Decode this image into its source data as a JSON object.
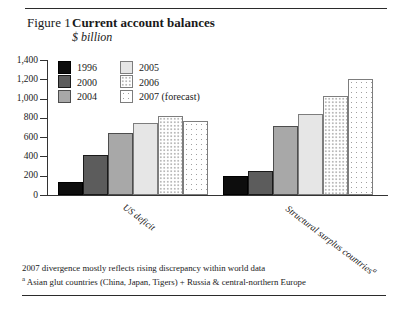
{
  "figure": {
    "label": "Figure 1",
    "title": "Current account balances",
    "subtitle": "$ billion"
  },
  "chart_data": {
    "type": "bar",
    "categories": [
      "US deficit",
      "Structural surplus countries"
    ],
    "category_footnote_marker": "a",
    "series": [
      {
        "name": "1996",
        "values": [
          130,
          200
        ],
        "fill": "#0d0d0d",
        "border": "#000000",
        "pattern": "solid"
      },
      {
        "name": "2000",
        "values": [
          420,
          245
        ],
        "fill": "#5c5c5c",
        "border": "#1a1a1a",
        "pattern": "solid"
      },
      {
        "name": "2004",
        "values": [
          640,
          720
        ],
        "fill": "#a8a8a8",
        "border": "#4d4d4d",
        "pattern": "solid"
      },
      {
        "name": "2005",
        "values": [
          750,
          840
        ],
        "fill": "#e6e6e6",
        "border": "#7d7d7d",
        "pattern": "solid"
      },
      {
        "name": "2006",
        "values": [
          815,
          1030
        ],
        "fill": "#ffffff",
        "border": "#7d7d7d",
        "pattern": "dots-fine"
      },
      {
        "name": "2007 (forecast)",
        "values": [
          770,
          1205
        ],
        "fill": "#ffffff",
        "border": "#7d7d7d",
        "pattern": "dots-coarse"
      }
    ],
    "ylim": [
      0,
      1400
    ],
    "ytick_step": 200,
    "ytick_labels": [
      "0",
      "200",
      "400",
      "600",
      "800",
      "1,000",
      "1,200",
      "1,400"
    ],
    "legend_position": "top-left",
    "grid": false
  },
  "footnotes": {
    "line1": "2007 divergence mostly reflects rising discrepancy within world data",
    "marker": "a",
    "line2": "Asian glut countries (China, Japan, Tigers) + Russia & central-northern Europe"
  }
}
